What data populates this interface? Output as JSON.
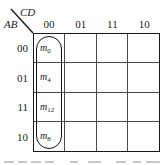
{
  "figure": {
    "column_axis_label": "CD",
    "row_axis_label": "AB",
    "line_color": "#1a1a1a",
    "grid_line_color": "#4a4a4a",
    "group_color": "#111111",
    "background": "#ffffff"
  },
  "columns": [
    {
      "header": "00"
    },
    {
      "header": "01"
    },
    {
      "header": "11"
    },
    {
      "header": "10"
    }
  ],
  "rows": [
    {
      "header": "00"
    },
    {
      "header": "01"
    },
    {
      "header": "11"
    },
    {
      "header": "10"
    }
  ],
  "cells": [
    [
      {
        "symbol": "m",
        "subscript": "0"
      },
      {
        "symbol": "",
        "subscript": ""
      },
      {
        "symbol": "",
        "subscript": ""
      },
      {
        "symbol": "",
        "subscript": ""
      }
    ],
    [
      {
        "symbol": "m",
        "subscript": "4"
      },
      {
        "symbol": "",
        "subscript": ""
      },
      {
        "symbol": "",
        "subscript": ""
      },
      {
        "symbol": "",
        "subscript": ""
      }
    ],
    [
      {
        "symbol": "m",
        "subscript": "12"
      },
      {
        "symbol": "",
        "subscript": ""
      },
      {
        "symbol": "",
        "subscript": ""
      },
      {
        "symbol": "",
        "subscript": ""
      }
    ],
    [
      {
        "symbol": "m",
        "subscript": "8"
      },
      {
        "symbol": "",
        "subscript": ""
      },
      {
        "symbol": "",
        "subscript": ""
      },
      {
        "symbol": "",
        "subscript": ""
      }
    ]
  ],
  "groups": [
    {
      "name": "column-00-group",
      "covers_minterms": "m0, m4, m12, m8",
      "column_index": 0,
      "row_span": 4
    }
  ]
}
